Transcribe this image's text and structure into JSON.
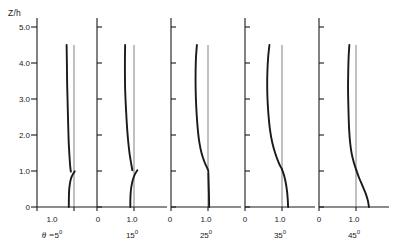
{
  "figure": {
    "y_axis": {
      "label": "Z/h",
      "ticks": [
        "5.0",
        "4.0",
        "3.0",
        "2.0",
        "1.0",
        "0"
      ],
      "tick_values": [
        5.0,
        4.0,
        3.0,
        2.0,
        1.0,
        0
      ],
      "min": 0,
      "max": 5.3
    },
    "x_axis": {
      "ticks": [
        "0",
        "1.0"
      ],
      "tick_values": [
        0,
        1.0
      ],
      "min": 0,
      "max": 1.75
    },
    "reference_line_value": "1.0",
    "panels": [
      {
        "label_prefix": "θ =",
        "label_value": "5",
        "label_unit": "0",
        "ticks": [
          "0",
          "1.0"
        ]
      },
      {
        "label_prefix": "",
        "label_value": "15",
        "label_unit": "0",
        "ticks": [
          "0",
          "1.0"
        ]
      },
      {
        "label_prefix": "",
        "label_value": "25",
        "label_unit": "0",
        "ticks": [
          "0",
          "1.0"
        ]
      },
      {
        "label_prefix": "",
        "label_value": "35",
        "label_unit": "0",
        "ticks": [
          "0",
          "1.0"
        ]
      },
      {
        "label_prefix": "",
        "label_value": "45",
        "label_unit": "0",
        "ticks": [
          "0",
          "1.0"
        ]
      }
    ]
  },
  "chart_data": {
    "type": "line",
    "title": "",
    "xlabel": "",
    "ylabel": "Z/h",
    "xlim": [
      0,
      1.75
    ],
    "ylim": [
      0,
      5.3
    ],
    "grid": false,
    "legend": "none",
    "layout": "five side-by-side panels sharing one Z/h axis at left",
    "y_ticks": [
      0,
      1.0,
      2.0,
      3.0,
      4.0,
      5.0
    ],
    "x_ticks": [
      0,
      1.0
    ],
    "reference_line": {
      "x": 1.0,
      "y_from": 0,
      "y_to": 4.5,
      "style": "thin vertical"
    },
    "series": [
      {
        "name": "θ = 5°",
        "panel": 0,
        "points": [
          [
            0.8,
            4.5
          ],
          [
            0.805,
            4.2
          ],
          [
            0.81,
            3.8
          ],
          [
            0.815,
            3.4
          ],
          [
            0.825,
            3.0
          ],
          [
            0.835,
            2.6
          ],
          [
            0.845,
            2.2
          ],
          [
            0.855,
            1.85
          ],
          [
            0.87,
            1.55
          ],
          [
            0.885,
            1.3
          ],
          [
            0.9,
            1.1
          ],
          [
            0.915,
            0.98
          ]
        ],
        "branch": [
          [
            0.86,
            0.0
          ],
          [
            0.862,
            0.25
          ],
          [
            0.868,
            0.45
          ],
          [
            0.885,
            0.62
          ],
          [
            0.915,
            0.78
          ],
          [
            0.965,
            0.9
          ],
          [
            1.02,
            0.99
          ]
        ]
      },
      {
        "name": "15°",
        "panel": 1,
        "points": [
          [
            0.76,
            4.5
          ],
          [
            0.755,
            4.1
          ],
          [
            0.755,
            3.7
          ],
          [
            0.76,
            3.3
          ],
          [
            0.775,
            2.9
          ],
          [
            0.795,
            2.5
          ],
          [
            0.82,
            2.1
          ],
          [
            0.85,
            1.75
          ],
          [
            0.885,
            1.45
          ],
          [
            0.925,
            1.2
          ],
          [
            0.955,
            1.02
          ]
        ],
        "branch": [
          [
            0.9,
            0.0
          ],
          [
            0.902,
            0.22
          ],
          [
            0.912,
            0.42
          ],
          [
            0.935,
            0.6
          ],
          [
            0.975,
            0.78
          ],
          [
            1.03,
            0.92
          ],
          [
            1.09,
            1.02
          ]
        ]
      },
      {
        "name": "25°",
        "panel": 2,
        "points": [
          [
            0.7,
            4.5
          ],
          [
            0.675,
            4.15
          ],
          [
            0.665,
            3.75
          ],
          [
            0.665,
            3.35
          ],
          [
            0.675,
            2.95
          ],
          [
            0.695,
            2.55
          ],
          [
            0.725,
            2.15
          ],
          [
            0.765,
            1.8
          ],
          [
            0.825,
            1.5
          ],
          [
            0.905,
            1.25
          ],
          [
            0.98,
            1.08
          ],
          [
            1.01,
            1.0
          ]
        ],
        "branch": [
          [
            1.03,
            0.0
          ],
          [
            1.028,
            0.25
          ],
          [
            1.022,
            0.5
          ],
          [
            1.015,
            0.75
          ],
          [
            1.01,
            0.95
          ]
        ]
      },
      {
        "name": "35°",
        "panel": 3,
        "points": [
          [
            0.66,
            4.5
          ],
          [
            0.625,
            4.15
          ],
          [
            0.605,
            3.75
          ],
          [
            0.6,
            3.35
          ],
          [
            0.61,
            2.95
          ],
          [
            0.635,
            2.55
          ],
          [
            0.675,
            2.15
          ],
          [
            0.735,
            1.8
          ],
          [
            0.815,
            1.5
          ],
          [
            0.915,
            1.22
          ],
          [
            1.0,
            1.05
          ]
        ],
        "branch": [
          [
            1.0,
            1.05
          ],
          [
            1.055,
            0.88
          ],
          [
            1.1,
            0.68
          ],
          [
            1.135,
            0.45
          ],
          [
            1.155,
            0.22
          ],
          [
            1.165,
            0.0
          ]
        ]
      },
      {
        "name": "45°",
        "panel": 4,
        "points": [
          [
            0.82,
            4.5
          ],
          [
            0.8,
            4.15
          ],
          [
            0.79,
            3.75
          ],
          [
            0.785,
            3.35
          ],
          [
            0.79,
            2.95
          ],
          [
            0.8,
            2.55
          ],
          [
            0.815,
            2.15
          ],
          [
            0.84,
            1.8
          ],
          [
            0.88,
            1.5
          ],
          [
            0.945,
            1.22
          ],
          [
            1.01,
            1.02
          ]
        ],
        "branch": [
          [
            1.01,
            1.02
          ],
          [
            1.08,
            0.82
          ],
          [
            1.17,
            0.6
          ],
          [
            1.26,
            0.38
          ],
          [
            1.32,
            0.18
          ],
          [
            1.35,
            0.0
          ]
        ]
      }
    ]
  }
}
